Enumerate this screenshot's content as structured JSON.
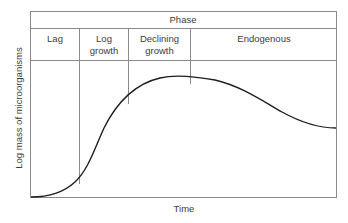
{
  "diagram": {
    "header": {
      "title": "Phase"
    },
    "phases": [
      {
        "label_line1": "Lag",
        "label_line2": ""
      },
      {
        "label_line1": "Log",
        "label_line2": "growth"
      },
      {
        "label_line1": "Declining",
        "label_line2": "growth"
      },
      {
        "label_line1": "Endogenous",
        "label_line2": ""
      }
    ],
    "axes": {
      "x_label": "Time",
      "y_label": "Log mass of microorganisms"
    },
    "curve": {
      "description": "Microbial growth curve: flat lag, steep log rise, peak in declining growth, gradual endogenous decline"
    },
    "colors": {
      "frame": "#8a8a8a",
      "curve": "#1e1e1e",
      "text": "#3c3c3c"
    }
  }
}
